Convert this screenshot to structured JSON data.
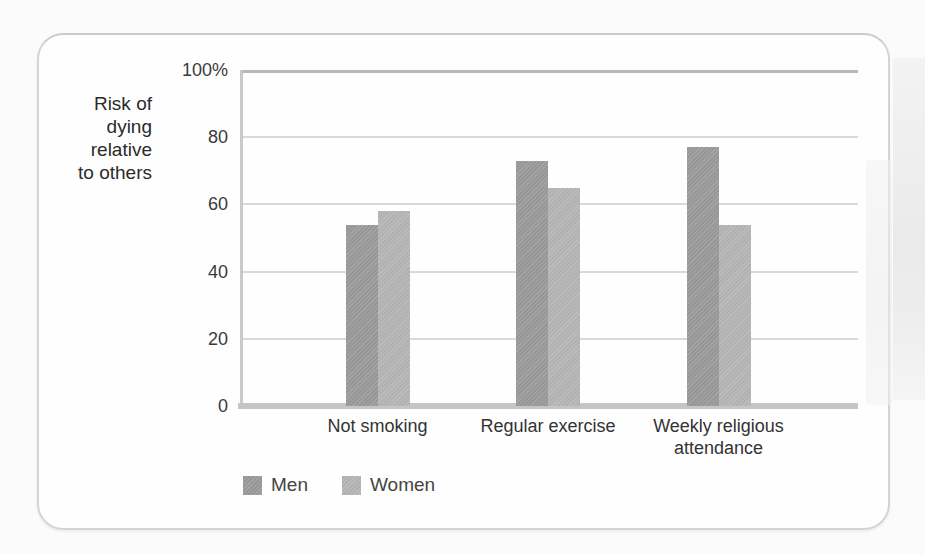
{
  "chart_data": {
    "type": "bar",
    "title": "",
    "ylabel": "Risk of dying relative to others",
    "ylabel_lines": [
      "Risk of",
      "dying",
      "relative",
      "to others"
    ],
    "categories": [
      "Not smoking",
      "Regular exercise",
      "Weekly religious attendance"
    ],
    "series": [
      {
        "name": "Men",
        "color": "#9b9b9b",
        "values": [
          54,
          73,
          77
        ]
      },
      {
        "name": "Women",
        "color": "#b6b6b6",
        "values": [
          58,
          65,
          54
        ]
      }
    ],
    "ylim": [
      0,
      100
    ],
    "y_ticks": [
      {
        "value": 0,
        "label": "0"
      },
      {
        "value": 20,
        "label": "20"
      },
      {
        "value": 40,
        "label": "40"
      },
      {
        "value": 60,
        "label": "60"
      },
      {
        "value": 80,
        "label": "80"
      },
      {
        "value": 100,
        "label": "100%"
      }
    ],
    "grid": true,
    "legend_position": "bottom-left",
    "colors": {
      "men_bar": "#9b9b9b",
      "women_bar": "#b6b6b6",
      "gridline": "#d9d9d9",
      "axis": "#c5c5c5",
      "text": "#333333"
    }
  }
}
